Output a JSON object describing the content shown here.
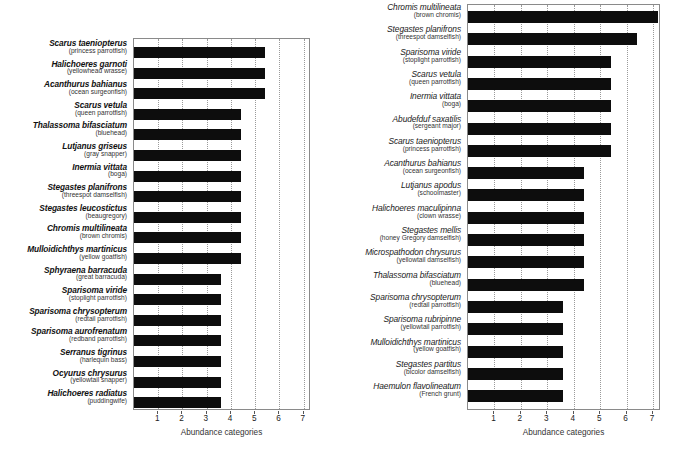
{
  "chart_data": [
    {
      "id": "left",
      "type": "bar",
      "orientation": "horizontal",
      "title": "",
      "xlabel": "Abundance categories",
      "ylabel": "",
      "xlim": [
        0,
        7.3
      ],
      "xticks": [
        1,
        2,
        3,
        4,
        5,
        6,
        7
      ],
      "grid": true,
      "grid_axis": "x",
      "legend": "none",
      "categories": [
        "Scarus taeniopterus",
        "Halichoeres garnoti",
        "Acanthurus bahianus",
        "Scarus vetula",
        "Thalassoma bifasciatum",
        "Lutjanus griseus",
        "Inermia vittata",
        "Stegastes planifrons",
        "Stegastes leucostictus",
        "Chromis multilineata",
        "Mulloidichthys martinicus",
        "Sphyraena barracuda",
        "Sparisoma viride",
        "Sparisoma chrysopterum",
        "Sparisoma aurofrenatum",
        "Serranus tigrinus",
        "Ocyurus chrysurus",
        "Halichoeres radiatus"
      ],
      "common_names": [
        "(princess parrotfish)",
        "(yellowhead wrasse)",
        "(ocean surgeonfish)",
        "(queen parrotfish)",
        "(bluehead)",
        "(gray snapper)",
        "(boga)",
        "(threespot damselfish)",
        "(beaugregory)",
        "(brown chromis)",
        "(yellow goatfish)",
        "(great barracuda)",
        "(stoplight parrotfish)",
        "(redtail parrotfish)",
        "(redband parrotfish)",
        "(harlequin bass)",
        "(yellowtail snapper)",
        "(puddingwife)"
      ],
      "values": [
        5.4,
        5.4,
        5.4,
        4.4,
        4.4,
        4.4,
        4.4,
        4.4,
        4.4,
        4.4,
        4.4,
        3.6,
        3.6,
        3.6,
        3.6,
        3.6,
        3.6,
        3.6
      ]
    },
    {
      "id": "right",
      "type": "bar",
      "orientation": "horizontal",
      "title": "",
      "xlabel": "Abundance categories",
      "ylabel": "",
      "xlim": [
        0,
        7.3
      ],
      "xticks": [
        1,
        2,
        3,
        4,
        5,
        6,
        7
      ],
      "grid": true,
      "grid_axis": "x",
      "legend": "none",
      "categories": [
        "Chromis multilineata",
        "Stegastes planifrons",
        "Sparisoma viride",
        "Scarus vetula",
        "Inermia vittata",
        "Abudefduf saxatilis",
        "Scarus taeniopterus",
        "Acanthurus bahianus",
        "Lutjanus apodus",
        "Halichoeres maculipinna",
        "Stegastes mellis",
        "Microspathodon chrysurus",
        "Thalassoma bifasciatum",
        "Sparisoma chrysopterum",
        "Sparisoma rubripinne",
        "Mulloidichthys martinicus",
        "Stegastes partitus",
        "Haemulon flavolineatum"
      ],
      "common_names": [
        "(brown chromis)",
        "(threespot damselfish)",
        "(stoplight parrotfish)",
        "(queen parrotfish)",
        "(boga)",
        "(sergeant major)",
        "(princess parrotfish)",
        "(ocean surgeonfish)",
        "(schoolmaster)",
        "(clown wrasse)",
        "(honey Gregory damselfish)",
        "(yellowtail damselfish)",
        "(bluehead)",
        "(redtail parrotfish)",
        "(yellowtail parrotfish)",
        "(yellow goatfish)",
        "(bicolor damselfish)",
        "(French grunt)"
      ],
      "values": [
        7.2,
        6.4,
        5.4,
        5.4,
        5.4,
        5.4,
        5.4,
        4.4,
        4.4,
        4.4,
        4.4,
        4.4,
        4.4,
        3.6,
        3.6,
        3.6,
        3.6,
        3.6
      ]
    }
  ],
  "colors": {
    "bar": "#0d0d0d",
    "grid": "#9a9a9a",
    "axis": "#8a8a8a",
    "text": "#111111"
  }
}
